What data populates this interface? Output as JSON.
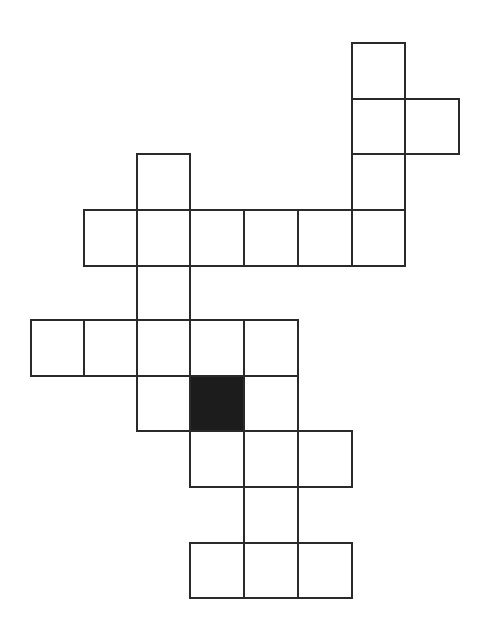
{
  "figure": {
    "type": "polyomino-grid",
    "cell_count": 25,
    "line_color": "#2a2a2a",
    "fill_color": "#1c1c1c",
    "background_color": "#ffffff",
    "x_boundaries": [
      31,
      84,
      137,
      190,
      244,
      298,
      352,
      405,
      459
    ],
    "y_boundaries": [
      43,
      99,
      154,
      210,
      266,
      320,
      376,
      431,
      487,
      543,
      598
    ],
    "rows": [
      {
        "row": 0,
        "cols": [
          6
        ]
      },
      {
        "row": 1,
        "cols": [
          6,
          7
        ]
      },
      {
        "row": 2,
        "cols": [
          2,
          6
        ]
      },
      {
        "row": 3,
        "cols": [
          1,
          2,
          3,
          4,
          5,
          6
        ]
      },
      {
        "row": 4,
        "cols": [
          2
        ]
      },
      {
        "row": 5,
        "cols": [
          0,
          1,
          2,
          3,
          4
        ]
      },
      {
        "row": 6,
        "cols": [
          2,
          3,
          4
        ]
      },
      {
        "row": 7,
        "cols": [
          3,
          4,
          5
        ]
      },
      {
        "row": 8,
        "cols": [
          4
        ]
      },
      {
        "row": 9,
        "cols": [
          3,
          4,
          5
        ]
      }
    ],
    "filled_cells": [
      {
        "row": 6,
        "col": 3
      }
    ]
  }
}
